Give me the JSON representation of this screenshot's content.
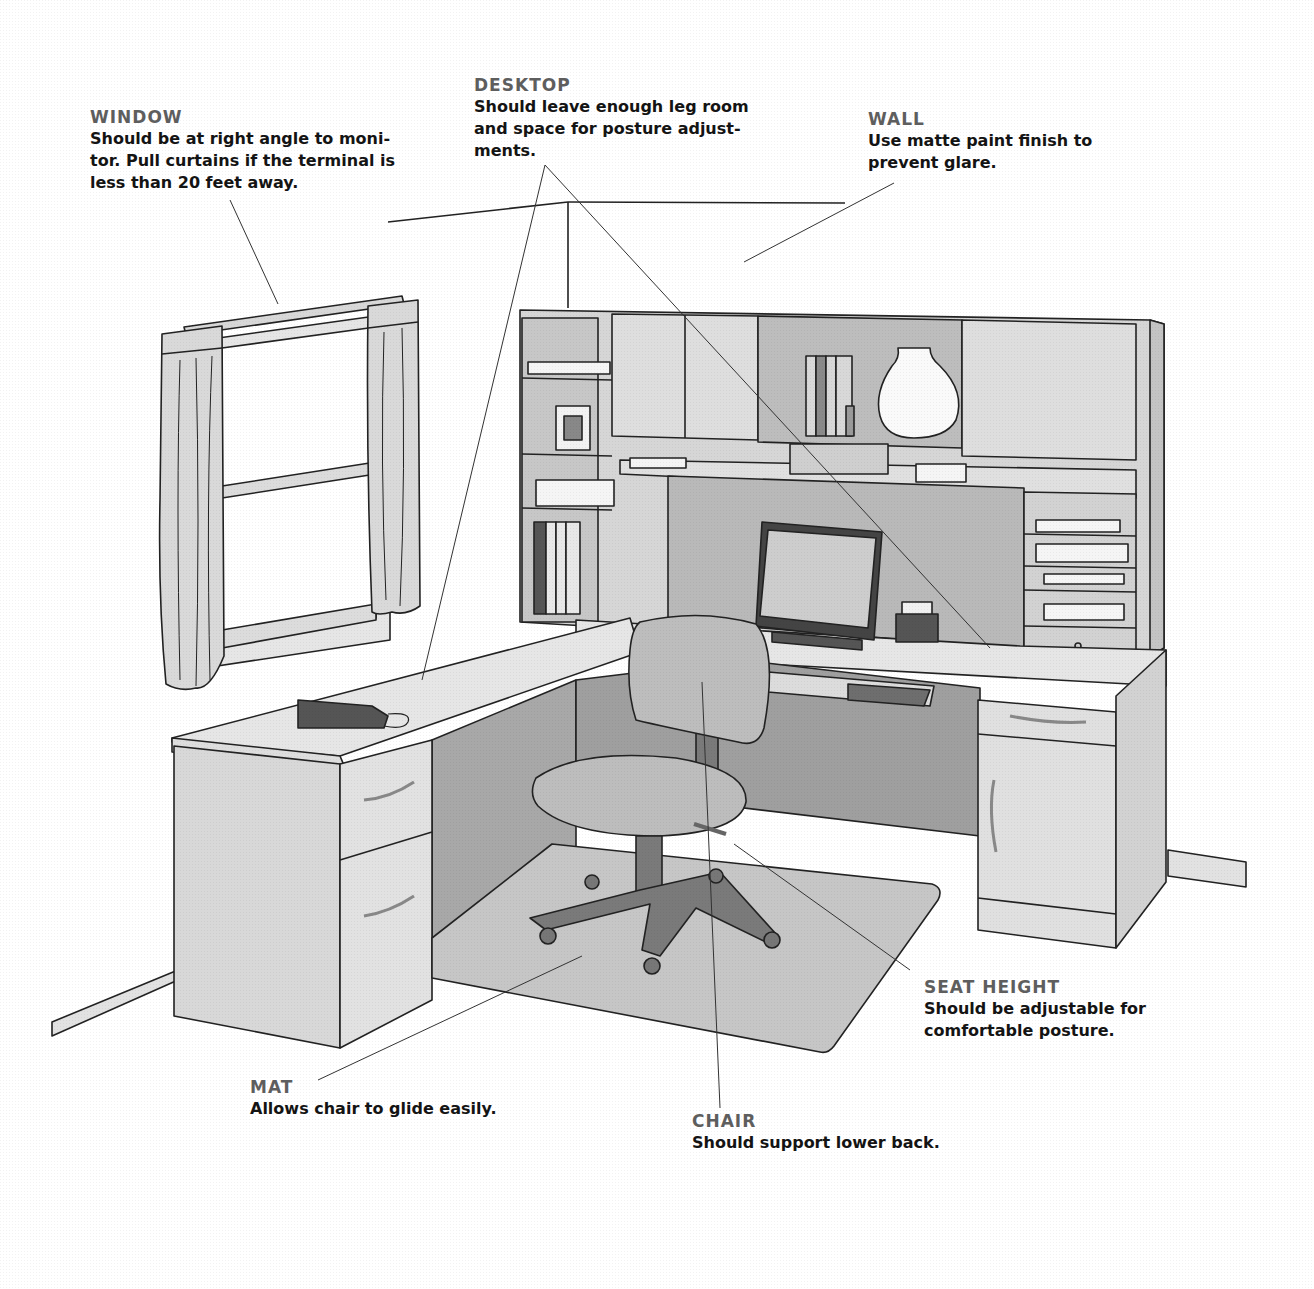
{
  "diagram": {
    "colors": {
      "background": "#ffffff",
      "label_title": "#5e5e5e",
      "label_body": "#141414",
      "furniture_light": "#e4e4e4",
      "furniture_mid": "#cfcfcf",
      "furniture_dark": "#a9a9a9",
      "chair": "#bdbdbd",
      "chair_base": "#7a7a7a",
      "mat": "#c6c6c6",
      "outline": "#222222"
    },
    "callouts": [
      {
        "id": "window",
        "title": "WINDOW",
        "text": "Should be at right angle to moni-\ntor. Pull curtains if the terminal is\nless than 20 feet away."
      },
      {
        "id": "desktop",
        "title": "DESKTOP",
        "text": "Should leave enough leg room\nand space for posture adjust-\nments."
      },
      {
        "id": "wall",
        "title": "WALL",
        "text": "Use matte paint finish to\nprevent glare."
      },
      {
        "id": "seat_height",
        "title": "SEAT HEIGHT",
        "text": "Should be adjustable for\ncomfortable posture."
      },
      {
        "id": "mat",
        "title": "MAT",
        "text": "Allows chair to glide easily."
      },
      {
        "id": "chair",
        "title": "CHAIR",
        "text": "Should support lower back."
      }
    ],
    "objects": [
      "window with curtains",
      "L-shaped desk",
      "hutch with shelves and cabinets",
      "monitor",
      "rolodex",
      "telephone",
      "keyboard tray",
      "task chair",
      "chair mat",
      "books",
      "vase",
      "picture frame"
    ]
  }
}
